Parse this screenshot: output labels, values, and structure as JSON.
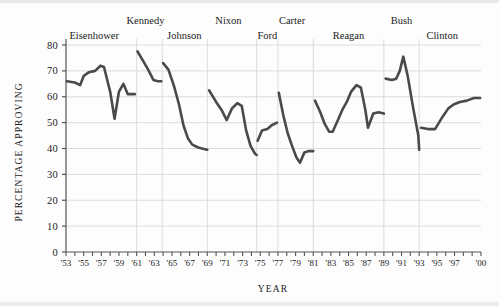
{
  "chart_data": {
    "type": "line",
    "title": "",
    "xlabel": "YEAR",
    "ylabel": "PERCENTAGE APPROVING",
    "xlim": [
      1953,
      2000
    ],
    "ylim": [
      0,
      80
    ],
    "yticks": [
      0,
      10,
      20,
      30,
      40,
      50,
      60,
      70,
      80
    ],
    "ytick_labels": [
      "0",
      "10",
      "20",
      "30",
      "40",
      "50",
      "60",
      "70",
      "80"
    ],
    "xtick_labels": [
      "'53",
      "'55",
      "'57",
      "'59",
      "'61",
      "'63",
      "'65",
      "'67",
      "'69",
      "'71",
      "'73",
      "'75",
      "'77",
      "'79",
      "'81",
      "'83",
      "'85",
      "'87",
      "'89",
      "'91",
      "'93",
      "'95",
      "'97",
      "'00"
    ],
    "xtick_years": [
      1953,
      1955,
      1957,
      1959,
      1961,
      1963,
      1965,
      1967,
      1969,
      1971,
      1973,
      1975,
      1977,
      1979,
      1981,
      1983,
      1985,
      1987,
      1989,
      1991,
      1993,
      1995,
      1997,
      2000
    ],
    "grid": "horizontal-and-term-dividers",
    "legend": "none",
    "line_color": "#4a4a4a",
    "grid_color": "#dcdcdc",
    "axis_color": "#555555",
    "term_divider_years": [
      1953,
      1961,
      1963.9,
      1969,
      1974.6,
      1977,
      1981,
      1989,
      1993
    ],
    "annotations": [
      {
        "label": "Eisenhower",
        "x": 1956.2,
        "row": 1
      },
      {
        "label": "Kennedy",
        "x": 1962.0,
        "row": 0
      },
      {
        "label": "Johnson",
        "x": 1966.4,
        "row": 1
      },
      {
        "label": "Nixon",
        "x": 1971.4,
        "row": 0
      },
      {
        "label": "Ford",
        "x": 1975.8,
        "row": 1
      },
      {
        "label": "Carter",
        "x": 1978.6,
        "row": 0
      },
      {
        "label": "Reagan",
        "x": 1985.0,
        "row": 1
      },
      {
        "label": "Bush",
        "x": 1991.0,
        "row": 0
      },
      {
        "label": "Clinton",
        "x": 1995.6,
        "row": 1
      }
    ],
    "series": [
      {
        "name": "Eisenhower",
        "points": [
          [
            1953.1,
            66.0
          ],
          [
            1954.0,
            65.5
          ],
          [
            1954.6,
            64.5
          ],
          [
            1955.0,
            68.0
          ],
          [
            1955.6,
            69.5
          ],
          [
            1956.3,
            70.0
          ],
          [
            1956.9,
            72.0
          ],
          [
            1957.3,
            71.5
          ],
          [
            1958.0,
            62.0
          ],
          [
            1958.5,
            51.5
          ],
          [
            1959.0,
            62.0
          ],
          [
            1959.5,
            65.0
          ],
          [
            1960.0,
            61.0
          ],
          [
            1960.8,
            61.0
          ]
        ]
      },
      {
        "name": "Kennedy",
        "points": [
          [
            1961.1,
            77.5
          ],
          [
            1961.8,
            73.5
          ],
          [
            1962.3,
            70.5
          ],
          [
            1962.9,
            66.5
          ],
          [
            1963.4,
            66.0
          ],
          [
            1963.8,
            66.0
          ]
        ]
      },
      {
        "name": "Johnson",
        "points": [
          [
            1964.0,
            73.0
          ],
          [
            1964.6,
            70.5
          ],
          [
            1965.2,
            64.5
          ],
          [
            1965.8,
            57.0
          ],
          [
            1966.3,
            49.0
          ],
          [
            1966.8,
            44.0
          ],
          [
            1967.3,
            41.5
          ],
          [
            1967.9,
            40.5
          ],
          [
            1968.4,
            40.0
          ],
          [
            1969.0,
            39.5
          ]
        ]
      },
      {
        "name": "Nixon",
        "points": [
          [
            1969.2,
            62.5
          ],
          [
            1970.0,
            58.0
          ],
          [
            1970.6,
            55.0
          ],
          [
            1971.2,
            51.0
          ],
          [
            1971.8,
            55.5
          ],
          [
            1972.4,
            57.5
          ],
          [
            1972.9,
            56.5
          ],
          [
            1973.4,
            47.0
          ],
          [
            1973.9,
            41.0
          ],
          [
            1974.4,
            38.0
          ],
          [
            1974.6,
            37.5
          ]
        ]
      },
      {
        "name": "Ford",
        "points": [
          [
            1974.7,
            43.0
          ],
          [
            1975.2,
            47.0
          ],
          [
            1975.8,
            47.5
          ],
          [
            1976.3,
            49.0
          ],
          [
            1976.9,
            50.0
          ]
        ]
      },
      {
        "name": "Carter",
        "points": [
          [
            1977.1,
            61.5
          ],
          [
            1977.6,
            53.0
          ],
          [
            1978.1,
            46.0
          ],
          [
            1978.6,
            41.0
          ],
          [
            1979.1,
            36.5
          ],
          [
            1979.5,
            34.5
          ],
          [
            1980.0,
            38.5
          ],
          [
            1980.5,
            39.0
          ],
          [
            1981.0,
            39.0
          ]
        ]
      },
      {
        "name": "Reagan",
        "points": [
          [
            1981.2,
            58.5
          ],
          [
            1981.8,
            54.0
          ],
          [
            1982.3,
            49.5
          ],
          [
            1982.8,
            46.5
          ],
          [
            1983.2,
            46.5
          ],
          [
            1983.8,
            51.0
          ],
          [
            1984.3,
            55.0
          ],
          [
            1984.8,
            58.0
          ],
          [
            1985.3,
            62.0
          ],
          [
            1985.9,
            64.5
          ],
          [
            1986.4,
            63.5
          ],
          [
            1986.9,
            55.0
          ],
          [
            1987.2,
            48.0
          ],
          [
            1987.8,
            53.5
          ],
          [
            1988.4,
            54.0
          ],
          [
            1989.0,
            53.5
          ]
        ]
      },
      {
        "name": "Bush",
        "points": [
          [
            1989.2,
            67.0
          ],
          [
            1989.9,
            66.5
          ],
          [
            1990.4,
            67.0
          ],
          [
            1990.8,
            70.0
          ],
          [
            1991.2,
            75.5
          ],
          [
            1991.7,
            68.0
          ],
          [
            1992.3,
            56.0
          ],
          [
            1992.9,
            45.0
          ],
          [
            1993.0,
            39.5
          ]
        ]
      },
      {
        "name": "Clinton",
        "points": [
          [
            1993.2,
            48.0
          ],
          [
            1994.0,
            47.5
          ],
          [
            1994.8,
            47.5
          ],
          [
            1995.6,
            52.0
          ],
          [
            1996.3,
            55.5
          ],
          [
            1996.9,
            57.0
          ],
          [
            1997.6,
            58.0
          ],
          [
            1998.4,
            58.5
          ],
          [
            1999.2,
            59.5
          ],
          [
            1999.9,
            59.5
          ]
        ]
      }
    ]
  }
}
